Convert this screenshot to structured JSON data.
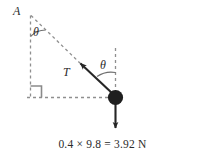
{
  "diagram": {
    "type": "free-body-pendulum-diagram",
    "background_color": "#ffffff",
    "stroke_color": "#3a3a3a",
    "dash_color": "#8a8a8a",
    "labels": {
      "pivot_point": "A",
      "tension": "T",
      "angle_at_pivot": "θ",
      "angle_at_bob": "θ"
    },
    "weight_caption": "0.4 × 9.8 = 3.92 N",
    "elements": {
      "pivot_label": "A",
      "vertical_dashed_line": "vertical-dashed-line",
      "horizontal_dashed_line": "horizontal-dashed-line",
      "hypotenuse_dashed_line": "string-extension-dashed-line",
      "right_angle_marker": "right-angle-marker",
      "tension_arrow": "tension-force-arrow",
      "weight_arrow": "weight-force-arrow",
      "bob": "pendulum-bob"
    }
  }
}
